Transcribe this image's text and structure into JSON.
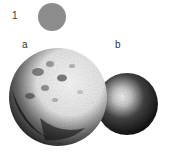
{
  "figure": {
    "labels": {
      "one": "1",
      "a": "a",
      "b": "b"
    },
    "items": [
      {
        "id": "1",
        "description": "small uniform gray disk",
        "color": "#8c8c8c"
      },
      {
        "id": "a",
        "description": "large cratered sphere (moon-like), lit from upper right",
        "highlight": "#f4f4f4",
        "shadow": "#111111"
      },
      {
        "id": "b",
        "description": "smaller smooth sphere with soft central highlight",
        "highlight": "#f0f0f0",
        "shadow": "#0d0d0d"
      }
    ]
  }
}
